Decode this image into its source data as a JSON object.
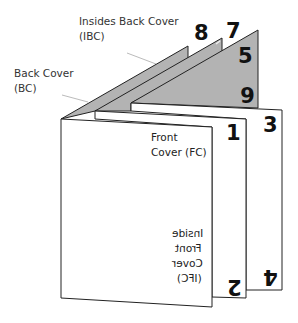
{
  "diagram": {
    "type": "folded booklet page layout",
    "labels": {
      "ibc": {
        "line1": "Insides Back Cover",
        "line2": "(IBC)"
      },
      "bc": {
        "line1": "Back Cover",
        "line2": "(BC)"
      },
      "fc": {
        "line1": "Front",
        "line2": "Cover (FC)"
      },
      "ifc": {
        "line1": "Inside",
        "line2": "Front",
        "line3": "Cover",
        "line4": "(IFC)"
      }
    },
    "page_numbers": {
      "p1": "1",
      "p2": "2",
      "p3": "3",
      "p4": "4",
      "p5": "5",
      "p6": "6",
      "p7": "7",
      "p8": "8"
    },
    "colors": {
      "panel": "#ffffff",
      "flap": "#b3b3b3",
      "stroke": "#222222",
      "leader": "#bbbbbb"
    }
  }
}
